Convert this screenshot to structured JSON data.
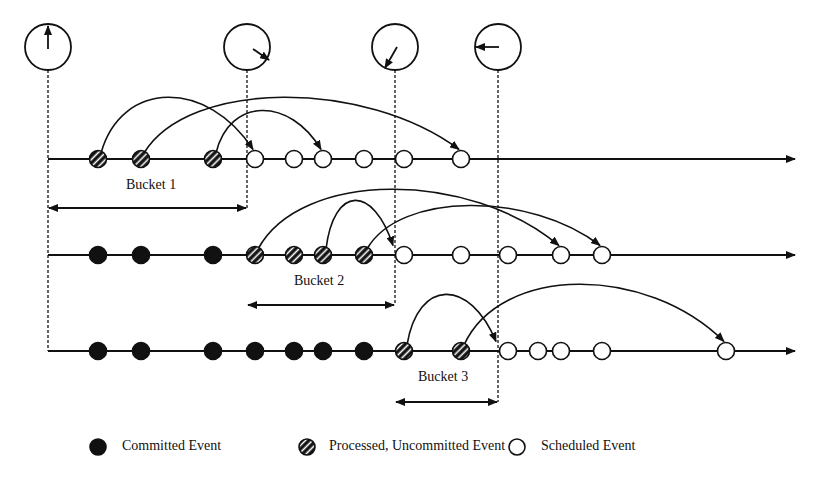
{
  "colors": {
    "ink": "#111111",
    "background": "#ffffff"
  },
  "clocks": [
    {
      "x": 48,
      "y": 47,
      "hand": "up",
      "angle_deg": 0
    },
    {
      "x": 247,
      "y": 47,
      "hand": "down-right",
      "angle_deg": 120
    },
    {
      "x": 395,
      "y": 47,
      "hand": "down-left",
      "angle_deg": 210
    },
    {
      "x": 498,
      "y": 47,
      "hand": "left",
      "angle_deg": 270
    }
  ],
  "time_markers_x": [
    48,
    247,
    395,
    498
  ],
  "rows": [
    {
      "y": 159,
      "events": [
        {
          "x": 98,
          "type": "processed"
        },
        {
          "x": 141,
          "type": "processed"
        },
        {
          "x": 213,
          "type": "processed"
        },
        {
          "x": 255,
          "type": "scheduled"
        },
        {
          "x": 294,
          "type": "scheduled"
        },
        {
          "x": 323,
          "type": "scheduled"
        },
        {
          "x": 364,
          "type": "scheduled"
        },
        {
          "x": 404,
          "type": "scheduled"
        },
        {
          "x": 461,
          "type": "scheduled"
        }
      ],
      "arcs": [
        {
          "from": 98,
          "to": 255,
          "peak": 100
        },
        {
          "from": 141,
          "to": 461,
          "peak": 100
        },
        {
          "from": 213,
          "to": 323,
          "peak": 113
        }
      ]
    },
    {
      "y": 255,
      "events": [
        {
          "x": 98,
          "type": "committed"
        },
        {
          "x": 141,
          "type": "committed"
        },
        {
          "x": 213,
          "type": "committed"
        },
        {
          "x": 255,
          "type": "processed"
        },
        {
          "x": 294,
          "type": "processed"
        },
        {
          "x": 323,
          "type": "processed"
        },
        {
          "x": 364,
          "type": "processed"
        },
        {
          "x": 404,
          "type": "scheduled"
        },
        {
          "x": 461,
          "type": "scheduled"
        },
        {
          "x": 508,
          "type": "scheduled"
        },
        {
          "x": 561,
          "type": "scheduled"
        },
        {
          "x": 602,
          "type": "scheduled"
        }
      ],
      "arcs": [
        {
          "from": 255,
          "to": 561,
          "peak": 192
        },
        {
          "from": 323,
          "to": 395,
          "peak": 203
        },
        {
          "from": 364,
          "to": 602,
          "peak": 208
        }
      ]
    },
    {
      "y": 351,
      "events": [
        {
          "x": 98,
          "type": "committed"
        },
        {
          "x": 141,
          "type": "committed"
        },
        {
          "x": 213,
          "type": "committed"
        },
        {
          "x": 255,
          "type": "committed"
        },
        {
          "x": 294,
          "type": "committed"
        },
        {
          "x": 323,
          "type": "committed"
        },
        {
          "x": 364,
          "type": "committed"
        },
        {
          "x": 404,
          "type": "processed"
        },
        {
          "x": 461,
          "type": "processed"
        },
        {
          "x": 508,
          "type": "scheduled"
        },
        {
          "x": 538,
          "type": "scheduled"
        },
        {
          "x": 561,
          "type": "scheduled"
        },
        {
          "x": 602,
          "type": "scheduled"
        },
        {
          "x": 726,
          "type": "scheduled"
        }
      ],
      "arcs": [
        {
          "from": 404,
          "to": 498,
          "peak": 297
        },
        {
          "from": 461,
          "to": 726,
          "peak": 287
        }
      ]
    }
  ],
  "buckets": [
    {
      "label": "Bucket 1",
      "x1": 48,
      "x2": 247,
      "y": 208,
      "label_x": 126,
      "label_y": 186
    },
    {
      "label": "Bucket 2",
      "x1": 247,
      "x2": 395,
      "y": 305,
      "label_x": 294,
      "label_y": 282
    },
    {
      "label": "Bucket 3",
      "x1": 395,
      "x2": 498,
      "y": 402,
      "label_x": 418,
      "label_y": 378
    }
  ],
  "legend": [
    {
      "type": "committed",
      "label": "Committed Event",
      "icon_x": 98,
      "text_x": 122
    },
    {
      "type": "processed",
      "label": "Processed, Uncommitted Event",
      "icon_x": 307,
      "text_x": 329
    },
    {
      "type": "scheduled",
      "label": "Scheduled Event",
      "icon_x": 517,
      "text_x": 541
    }
  ],
  "legend_y": 447
}
